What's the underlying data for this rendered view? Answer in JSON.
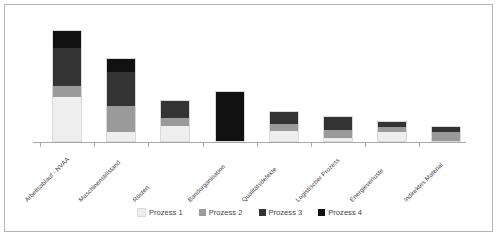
{
  "chart_data": {
    "type": "bar",
    "subtype": "stacked-bar",
    "title": "",
    "xlabel": "",
    "ylabel": "",
    "grid": false,
    "legend_position": "bottom",
    "ylim": [
      0,
      120
    ],
    "categories": [
      "Arbeitsablauf - NVAA",
      "Maschinenstillstand",
      "Rüsten",
      "Bandorganisation",
      "Qualitätsdefekte",
      "Logistischer Prozess",
      "Energieverluste",
      "Indirektes Material"
    ],
    "series": [
      {
        "name": "Prozess 1",
        "color": "#eeeeee",
        "values": [
          46,
          9,
          16,
          0,
          11,
          3,
          10,
          0
        ]
      },
      {
        "name": "Prozess 2",
        "color": "#9a9a9a",
        "values": [
          11,
          27,
          9,
          0,
          8,
          9,
          6,
          10
        ]
      },
      {
        "name": "Prozess 3",
        "color": "#333333",
        "values": [
          39,
          36,
          18,
          0,
          13,
          14,
          5,
          6
        ]
      },
      {
        "name": "Prozess 4",
        "color": "#111111",
        "values": [
          18,
          13,
          0,
          52,
          0,
          0,
          0,
          0
        ]
      }
    ],
    "totals": [
      114,
      85,
      43,
      52,
      32,
      26,
      21,
      16
    ]
  },
  "legend": {
    "items": [
      {
        "label": "Prozess 1",
        "color": "#eeeeee"
      },
      {
        "label": "Prozess 2",
        "color": "#9a9a9a"
      },
      {
        "label": "Prozess 3",
        "color": "#333333"
      },
      {
        "label": "Prozess 4",
        "color": "#111111"
      }
    ]
  },
  "axis": {
    "baseline_color": "#a9a9a9",
    "tick_count": 8
  },
  "frame": {
    "border_color": "#b6b6b6",
    "background": "#ffffff"
  }
}
